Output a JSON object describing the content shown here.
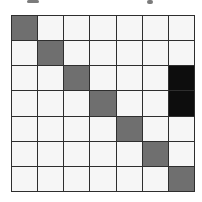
{
  "figure": {
    "artifacts": [
      {
        "name": "cropped-text-fragment-left"
      },
      {
        "name": "cropped-text-fragment-right"
      }
    ]
  },
  "chart_data": {
    "type": "heatmap",
    "title": "",
    "xlabel": "",
    "ylabel": "",
    "rows": 7,
    "cols": 7,
    "matrix": [
      [
        1,
        0,
        0,
        0,
        0,
        0,
        0
      ],
      [
        0,
        1,
        0,
        0,
        0,
        0,
        0
      ],
      [
        0,
        0,
        1,
        0,
        0,
        0,
        2
      ],
      [
        0,
        0,
        0,
        1,
        0,
        0,
        2
      ],
      [
        0,
        0,
        0,
        0,
        1,
        0,
        0
      ],
      [
        0,
        0,
        0,
        0,
        0,
        1,
        0
      ],
      [
        0,
        0,
        0,
        0,
        0,
        0,
        1
      ]
    ],
    "value_legend": {
      "0": "empty",
      "1": "diagonal-gray",
      "2": "highlight-black"
    },
    "colors": {
      "0": "#f6f6f6",
      "1": "#6f6f6f",
      "2": "#0d0d0d"
    },
    "gridline_color": "#2e2e2e",
    "background_color": "#ffffff",
    "grid": true,
    "legend_position": "none"
  }
}
